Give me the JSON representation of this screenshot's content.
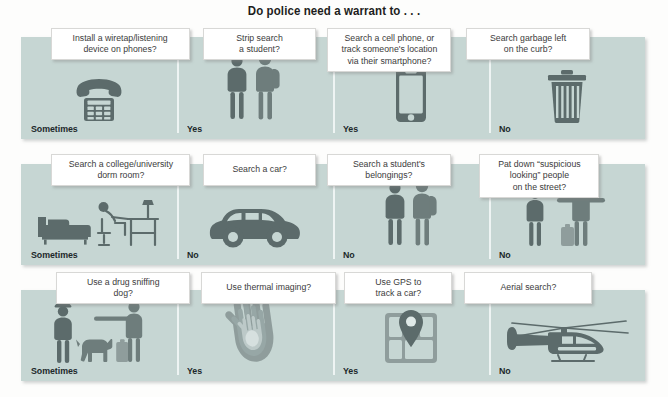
{
  "title": "Do police need a warrant to . . .",
  "theme": {
    "band_color": "#c6d6d3",
    "card_bg": "#ffffff",
    "icon_color": "#5c6b6b",
    "text_color": "#3b3b3b",
    "answer_color": "#20282a",
    "page_bg": "#fdfdfc"
  },
  "rows": [
    {
      "cells": [
        {
          "question": "Install a wiretap/listening\ndevice on phones?",
          "answer": "Sometimes",
          "icon": "desk-telephone-icon"
        },
        {
          "question": "Strip search\na student?",
          "answer": "Yes",
          "icon": "officer-and-student-icon"
        },
        {
          "question": "Search a cell phone, or\ntrack someone's location\nvia their smartphone?",
          "answer": "Yes",
          "icon": "smartphone-icon"
        },
        {
          "question": "Search garbage left\non the curb?",
          "answer": "No",
          "icon": "trash-can-icon"
        }
      ]
    },
    {
      "cells": [
        {
          "question": "Search a college/university\ndorm room?",
          "answer": "Sometimes",
          "icon": "dorm-room-icon"
        },
        {
          "question": "Search a car?",
          "answer": "No",
          "icon": "car-icon"
        },
        {
          "question": "Search a student's\nbelongings?",
          "answer": "No",
          "icon": "officer-and-backpack-student-icon"
        },
        {
          "question": "Pat down “suspicious\nlooking” people\non the street?",
          "answer": "No",
          "icon": "pat-down-icon"
        }
      ]
    },
    {
      "cells": [
        {
          "question": "Use a drug sniffing\ndog?",
          "answer": "Sometimes",
          "icon": "police-dog-icon"
        },
        {
          "question": "Use thermal imaging?",
          "answer": "Yes",
          "icon": "thermal-hand-icon"
        },
        {
          "question": "Use GPS to\ntrack a car?",
          "answer": "Yes",
          "icon": "gps-map-pin-icon"
        },
        {
          "question": "Aerial search?",
          "answer": "No",
          "icon": "helicopter-icon"
        }
      ]
    }
  ]
}
